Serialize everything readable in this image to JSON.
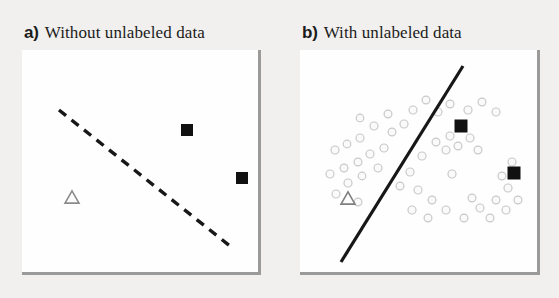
{
  "figure": {
    "width": 559,
    "height": 298,
    "background_color": "#f1f0ee",
    "caption_font_color": "#1b1b1b"
  },
  "panels": [
    {
      "id": "panel-a",
      "letter": "a)",
      "title": "Without unlabeled data",
      "label_x": 24,
      "label_y": 24,
      "plot": {
        "x": 22,
        "y": 50,
        "width": 236,
        "height": 222,
        "background_color": "#fefefe"
      },
      "boundary": {
        "style": "dashed",
        "color": "#171717",
        "width": 3.4,
        "dash": "9 7",
        "x1": 37,
        "y1": 60,
        "x2": 208,
        "y2": 196
      },
      "markers": {
        "squares": [
          {
            "cx": 165,
            "cy": 80,
            "size": 12,
            "color": "#111111"
          },
          {
            "cx": 220,
            "cy": 128,
            "size": 12,
            "color": "#111111"
          }
        ],
        "triangles": [
          {
            "cx": 50,
            "cy": 147,
            "size": 14,
            "stroke": "#8b8b8b",
            "fill": "#fbfbfb"
          }
        ],
        "unlabeled_points": []
      }
    },
    {
      "id": "panel-b",
      "letter": "b)",
      "title": "With unlabeled data",
      "label_x": 302,
      "label_y": 24,
      "plot": {
        "x": 300,
        "y": 50,
        "width": 237,
        "height": 222,
        "background_color": "#fefefe"
      },
      "boundary": {
        "style": "solid",
        "color": "#171717",
        "width": 3.2,
        "dash": "",
        "x1": 163,
        "y1": 16,
        "x2": 41,
        "y2": 212
      },
      "markers": {
        "squares": [
          {
            "cx": 161,
            "cy": 76,
            "size": 13,
            "color": "#111111"
          },
          {
            "cx": 214,
            "cy": 123,
            "size": 13,
            "color": "#111111"
          }
        ],
        "triangles": [
          {
            "cx": 48,
            "cy": 148,
            "size": 14,
            "stroke": "#7f7f7f",
            "fill": "#fbfbfb"
          }
        ],
        "unlabeled_points": [
          {
            "cx": 35,
            "cy": 100,
            "r": 4.0
          },
          {
            "cx": 47,
            "cy": 94,
            "r": 3.8
          },
          {
            "cx": 60,
            "cy": 88,
            "r": 4.0
          },
          {
            "cx": 70,
            "cy": 104,
            "r": 4.0
          },
          {
            "cx": 58,
            "cy": 112,
            "r": 3.9
          },
          {
            "cx": 44,
            "cy": 118,
            "r": 3.9
          },
          {
            "cx": 30,
            "cy": 124,
            "r": 4.0
          },
          {
            "cx": 48,
            "cy": 133,
            "r": 4.0
          },
          {
            "cx": 62,
            "cy": 126,
            "r": 3.8
          },
          {
            "cx": 78,
            "cy": 118,
            "r": 4.0
          },
          {
            "cx": 84,
            "cy": 98,
            "r": 4.0
          },
          {
            "cx": 92,
            "cy": 82,
            "r": 3.9
          },
          {
            "cx": 74,
            "cy": 76,
            "r": 4.0
          },
          {
            "cx": 60,
            "cy": 68,
            "r": 3.8
          },
          {
            "cx": 88,
            "cy": 64,
            "r": 3.9
          },
          {
            "cx": 104,
            "cy": 74,
            "r": 4.0
          },
          {
            "cx": 36,
            "cy": 144,
            "r": 4.0
          },
          {
            "cx": 58,
            "cy": 152,
            "r": 3.9
          },
          {
            "cx": 113,
            "cy": 60,
            "r": 4.0
          },
          {
            "cx": 126,
            "cy": 50,
            "r": 3.9
          },
          {
            "cx": 138,
            "cy": 62,
            "r": 4.0
          },
          {
            "cx": 150,
            "cy": 54,
            "r": 3.9
          },
          {
            "cx": 168,
            "cy": 60,
            "r": 4.0
          },
          {
            "cx": 182,
            "cy": 52,
            "r": 3.9
          },
          {
            "cx": 196,
            "cy": 62,
            "r": 4.0
          },
          {
            "cx": 150,
            "cy": 86,
            "r": 4.0
          },
          {
            "cx": 136,
            "cy": 92,
            "r": 3.9
          },
          {
            "cx": 146,
            "cy": 100,
            "r": 4.0
          },
          {
            "cx": 158,
            "cy": 96,
            "r": 3.9
          },
          {
            "cx": 170,
            "cy": 88,
            "r": 4.0
          },
          {
            "cx": 178,
            "cy": 100,
            "r": 3.9
          },
          {
            "cx": 122,
            "cy": 106,
            "r": 4.0
          },
          {
            "cx": 110,
            "cy": 122,
            "r": 4.0
          },
          {
            "cx": 100,
            "cy": 136,
            "r": 3.9
          },
          {
            "cx": 118,
            "cy": 140,
            "r": 4.0
          },
          {
            "cx": 132,
            "cy": 150,
            "r": 3.9
          },
          {
            "cx": 112,
            "cy": 160,
            "r": 4.0
          },
          {
            "cx": 128,
            "cy": 168,
            "r": 3.9
          },
          {
            "cx": 146,
            "cy": 160,
            "r": 4.0
          },
          {
            "cx": 164,
            "cy": 168,
            "r": 3.9
          },
          {
            "cx": 180,
            "cy": 158,
            "r": 4.0
          },
          {
            "cx": 196,
            "cy": 150,
            "r": 3.9
          },
          {
            "cx": 208,
            "cy": 138,
            "r": 4.0
          },
          {
            "cx": 202,
            "cy": 126,
            "r": 3.9
          },
          {
            "cx": 212,
            "cy": 112,
            "r": 4.0
          },
          {
            "cx": 190,
            "cy": 168,
            "r": 3.9
          },
          {
            "cx": 206,
            "cy": 160,
            "r": 4.0
          },
          {
            "cx": 172,
            "cy": 148,
            "r": 3.9
          },
          {
            "cx": 152,
            "cy": 124,
            "r": 4.0
          },
          {
            "cx": 218,
            "cy": 150,
            "r": 3.9
          }
        ],
        "point_style": {
          "stroke": "#c9c9c9",
          "fill": "#fafafa",
          "stroke_width": 1.2
        }
      }
    }
  ]
}
